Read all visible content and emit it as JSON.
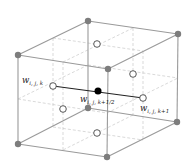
{
  "diagram": {
    "colors": {
      "edge": "#9a9a9a",
      "dashed": "#c8c8c8",
      "vertex": "#7d7d7d",
      "open_node_fill": "#ffffff",
      "open_node_stroke": "#444444",
      "center_node": "#000000",
      "connector": "#222222"
    },
    "labels": {
      "left": "w",
      "left_sub": "i, j, k",
      "center": "w",
      "center_sub": "i, j, k+1/2",
      "right": "w",
      "right_sub": "i, j, k+1"
    },
    "vertices": [
      {
        "name": "back-top-left",
        "x": 88,
        "y": 21
      },
      {
        "name": "back-top-right",
        "x": 178,
        "y": 34
      },
      {
        "name": "front-top-left",
        "x": 18,
        "y": 55
      },
      {
        "name": "front-top-right",
        "x": 108,
        "y": 69
      },
      {
        "name": "back-bottom-left",
        "x": 88,
        "y": 108
      },
      {
        "name": "back-bottom-right",
        "x": 177,
        "y": 122
      },
      {
        "name": "front-bottom-left",
        "x": 18,
        "y": 144
      },
      {
        "name": "front-bottom-right",
        "x": 107,
        "y": 157
      }
    ],
    "face_nodes": [
      {
        "name": "top-face",
        "x": 97,
        "y": 44
      },
      {
        "name": "right-back-face",
        "x": 133,
        "y": 74
      },
      {
        "name": "left-face-w-i-j-k",
        "x": 53,
        "y": 86
      },
      {
        "name": "right-face-w-i-j-k1",
        "x": 143,
        "y": 98
      },
      {
        "name": "front-lower-face",
        "x": 63,
        "y": 109
      },
      {
        "name": "bottom-face",
        "x": 97,
        "y": 133
      }
    ],
    "center_node": {
      "name": "w-i-j-k-half",
      "x": 98,
      "y": 91
    }
  }
}
